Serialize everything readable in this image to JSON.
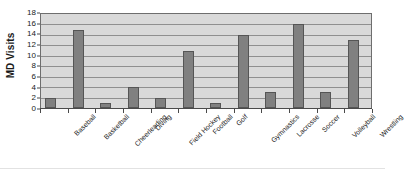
{
  "chart_data": {
    "type": "bar",
    "title": "",
    "xlabel": "",
    "ylabel": "MD Visits",
    "ylim": [
      0,
      18
    ],
    "ytick_step": 2,
    "yticks": [
      0,
      2,
      4,
      6,
      8,
      10,
      12,
      14,
      16,
      18
    ],
    "grid": true,
    "legend": "none",
    "categories": [
      "Baseball",
      "Basketball",
      "Cheerleading",
      "Diving",
      "Field Hockey",
      "Football",
      "Golf",
      "Gymnastics",
      "Lacrosse",
      "Soccer",
      "Volleyball",
      "Wrestling"
    ],
    "values": [
      2,
      15,
      1,
      4,
      2,
      11,
      1,
      14,
      3,
      16,
      3,
      13
    ],
    "colors": {
      "bar_fill": "#808080",
      "bar_outline": "#555555",
      "plot_background": "#d9d9d9",
      "gridline": "#8f8f8f",
      "axis": "#4a4a4a",
      "text": "#1a1a1a",
      "page_background": "#ffffff"
    }
  }
}
